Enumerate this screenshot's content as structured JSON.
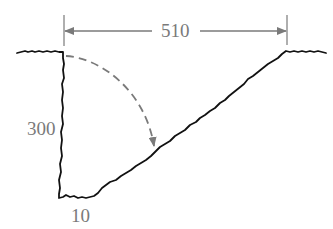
{
  "diagram": {
    "labels": {
      "top_width": "510",
      "depth": "300",
      "bottom_width": "10"
    },
    "colors": {
      "ground_line": "#111111",
      "dimension": "#7a7a7a",
      "arc": "#7a7a7a",
      "background": "#ffffff"
    },
    "elements": {
      "dimension_line": "horizontal arrowed dimension spanning top opening",
      "dashed_arc": "dashed curved arrow from top of vertical wall to the sloped side"
    }
  }
}
